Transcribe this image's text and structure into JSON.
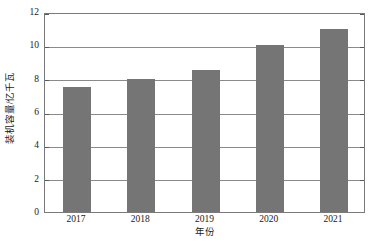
{
  "chart_data": {
    "type": "bar",
    "title": "",
    "xlabel": "年份",
    "ylabel": "装机容量/亿千瓦",
    "categories": [
      "2017",
      "2018",
      "2019",
      "2020",
      "2021"
    ],
    "values": [
      7.5,
      8.0,
      8.5,
      10.0,
      11.0
    ],
    "ylim": [
      0,
      12
    ],
    "ytick_values": [
      0,
      2,
      4,
      6,
      8,
      10,
      12
    ],
    "ytick_labels": [
      "0",
      "2",
      "4",
      "6",
      "8",
      "10",
      "12"
    ],
    "grid": true,
    "legend": "none",
    "series": [
      {
        "name": "装机容量",
        "values": [
          7.5,
          8.0,
          8.5,
          10.0,
          11.0
        ],
        "color": "#757575"
      }
    ],
    "bar_color": "#757575",
    "frame_color": "#7a7a7a",
    "gridline_color": "#8a8a8a",
    "background_color": "#ffffff"
  }
}
